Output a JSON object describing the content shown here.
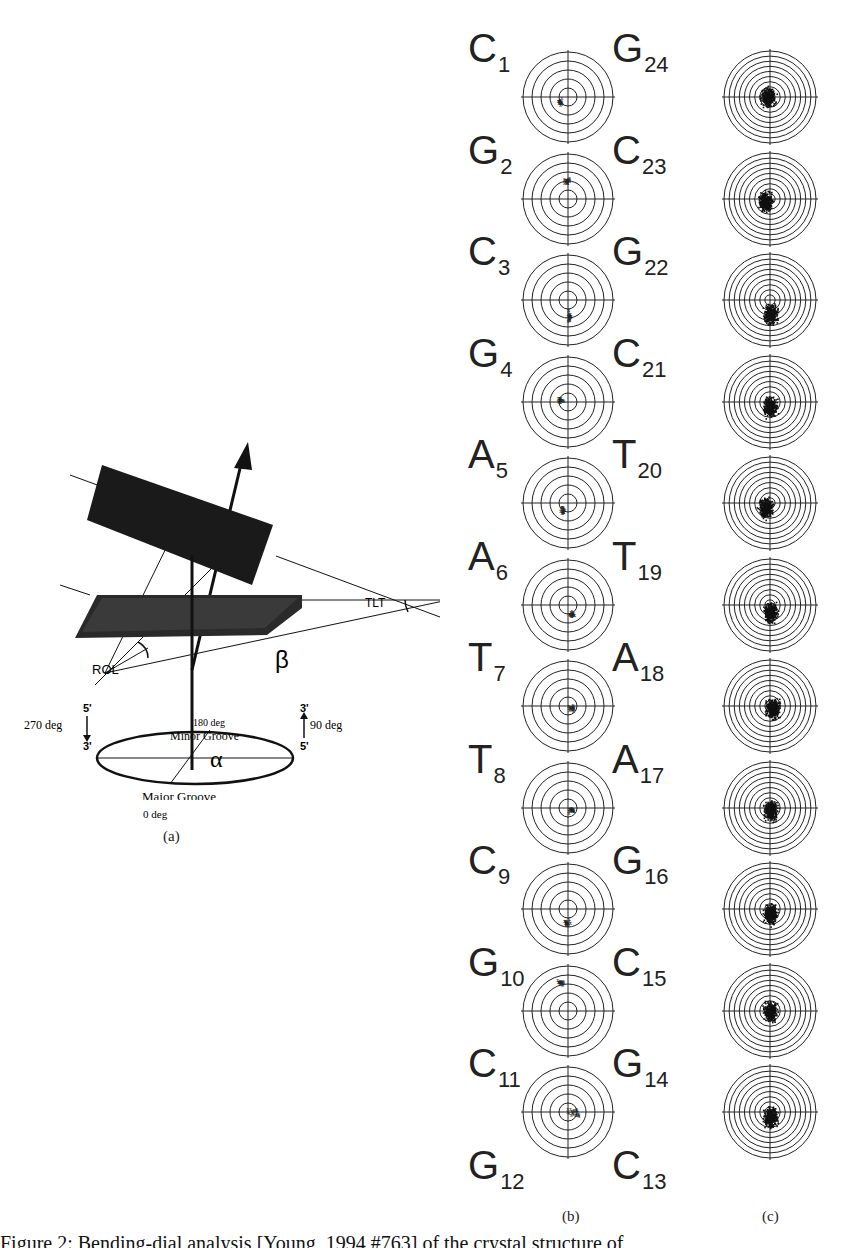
{
  "figure": {
    "panel_a": {
      "label": "(a)",
      "tlt_label": "TLT",
      "rol_label": "ROL",
      "beta_label": "β",
      "alpha_label": "α",
      "minor_groove_deg": "180 deg",
      "minor_groove_label": "Minor Groove",
      "major_groove_label": "Major Groove",
      "major_groove_deg": "0 deg",
      "left_deg": "270 deg",
      "right_deg": "90 deg",
      "left_top_end": "5'",
      "left_bottom_end": "3'",
      "right_top_end": "3'",
      "right_bottom_end": "5'"
    },
    "panel_b": {
      "label": "(b)",
      "rings": 5,
      "left_strand": [
        {
          "base": "C",
          "index": "1"
        },
        {
          "base": "G",
          "index": "2"
        },
        {
          "base": "C",
          "index": "3"
        },
        {
          "base": "G",
          "index": "4"
        },
        {
          "base": "A",
          "index": "5"
        },
        {
          "base": "A",
          "index": "6"
        },
        {
          "base": "T",
          "index": "7"
        },
        {
          "base": "T",
          "index": "8"
        },
        {
          "base": "C",
          "index": "9"
        },
        {
          "base": "G",
          "index": "10"
        },
        {
          "base": "C",
          "index": "11"
        },
        {
          "base": "G",
          "index": "12"
        }
      ],
      "right_strand": [
        {
          "base": "G",
          "index": "24"
        },
        {
          "base": "C",
          "index": "23"
        },
        {
          "base": "G",
          "index": "22"
        },
        {
          "base": "C",
          "index": "21"
        },
        {
          "base": "T",
          "index": "20"
        },
        {
          "base": "T",
          "index": "19"
        },
        {
          "base": "A",
          "index": "18"
        },
        {
          "base": "A",
          "index": "17"
        },
        {
          "base": "G",
          "index": "16"
        },
        {
          "base": "C",
          "index": "15"
        },
        {
          "base": "G",
          "index": "14"
        },
        {
          "base": "C",
          "index": "13"
        }
      ]
    },
    "panel_c": {
      "label": "(c)",
      "rings": 9
    },
    "caption_text": "Figure 2: Bending-dial analysis [Young, 1994 #763] of the crystal structure of"
  },
  "chart_data": {
    "type": "scatter",
    "panels": [
      {
        "name": "(b)",
        "kind": "polar scatter (x markers), 5 rings",
        "dials": [
          {
            "step": "C1/G24",
            "cluster_center": [
              -0.15,
              -0.1
            ],
            "spread": "small"
          },
          {
            "step": "G2/C23",
            "cluster_center": [
              0.0,
              0.4
            ],
            "spread": "small"
          },
          {
            "step": "C3/G22",
            "cluster_center": [
              0.05,
              -0.35
            ],
            "spread": "elongated vertical"
          },
          {
            "step": "G4/C21",
            "cluster_center": [
              -0.15,
              0.05
            ],
            "spread": "small"
          },
          {
            "step": "A5/T20",
            "cluster_center": [
              -0.1,
              -0.15
            ],
            "spread": "small"
          },
          {
            "step": "A6/T19",
            "cluster_center": [
              0.1,
              -0.2
            ],
            "spread": "small"
          },
          {
            "step": "T7/A18",
            "cluster_center": [
              0.1,
              -0.05
            ],
            "spread": "small"
          },
          {
            "step": "T8/A17",
            "cluster_center": [
              0.1,
              -0.05
            ],
            "spread": "small"
          },
          {
            "step": "C9/G16",
            "cluster_center": [
              0.0,
              -0.3
            ],
            "spread": "small"
          },
          {
            "step": "G10/C15",
            "cluster_center": [
              -0.15,
              0.65
            ],
            "spread": "small"
          },
          {
            "step": "C11/G14",
            "cluster_center": [
              0.15,
              0.0
            ],
            "spread": "scattered"
          }
        ]
      },
      {
        "name": "(c)",
        "kind": "polar scatter (dots), 9 rings, dense clouds",
        "dials": [
          {
            "step": "1",
            "cluster_center": [
              -0.05,
              0.0
            ]
          },
          {
            "step": "2",
            "cluster_center": [
              -0.1,
              -0.05
            ]
          },
          {
            "step": "3",
            "cluster_center": [
              0.0,
              -0.3
            ]
          },
          {
            "step": "4",
            "cluster_center": [
              0.0,
              -0.1
            ]
          },
          {
            "step": "5",
            "cluster_center": [
              -0.1,
              -0.1
            ]
          },
          {
            "step": "6",
            "cluster_center": [
              0.0,
              -0.15
            ]
          },
          {
            "step": "7",
            "cluster_center": [
              0.05,
              -0.05
            ]
          },
          {
            "step": "8",
            "cluster_center": [
              0.0,
              -0.05
            ]
          },
          {
            "step": "9",
            "cluster_center": [
              0.0,
              -0.1
            ]
          },
          {
            "step": "10",
            "cluster_center": [
              0.0,
              0.0
            ]
          },
          {
            "step": "11",
            "cluster_center": [
              0.0,
              -0.1
            ]
          }
        ]
      }
    ]
  }
}
